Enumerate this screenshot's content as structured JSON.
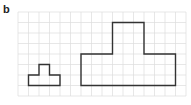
{
  "panel_label": "b",
  "grid": {
    "origin_x": 18,
    "origin_y": 12,
    "cell": 10.5,
    "cols": 16,
    "rows": 8,
    "line_color": "#dcdcdc",
    "border_color": "#e6e6e6"
  },
  "shapes": [
    {
      "name": "small-t-shape",
      "stroke": "#333333",
      "points_cells": [
        [
          1,
          7
        ],
        [
          1,
          6
        ],
        [
          2,
          6
        ],
        [
          2,
          5
        ],
        [
          3,
          5
        ],
        [
          3,
          6
        ],
        [
          4,
          6
        ],
        [
          4,
          7
        ]
      ]
    },
    {
      "name": "large-t-shape",
      "stroke": "#333333",
      "points_cells": [
        [
          6,
          7
        ],
        [
          6,
          4
        ],
        [
          9,
          4
        ],
        [
          9,
          1
        ],
        [
          12,
          1
        ],
        [
          12,
          4
        ],
        [
          15,
          4
        ],
        [
          15,
          7
        ]
      ]
    }
  ]
}
